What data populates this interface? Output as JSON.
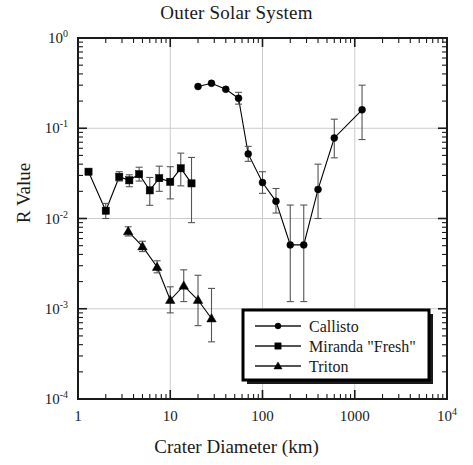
{
  "chart_data": {
    "type": "line",
    "title": "Outer Solar System",
    "xlabel": "Crater Diameter (km)",
    "ylabel": "R Value",
    "xscale": "log",
    "yscale": "log",
    "xlim": [
      1,
      10000
    ],
    "ylim": [
      0.0001,
      1
    ],
    "grid": true,
    "legend_position": "bottom-right",
    "xticks": [
      1,
      10,
      100,
      1000,
      10000
    ],
    "xtick_labels": [
      "1",
      "10",
      "100",
      "1000",
      "10^4"
    ],
    "yticks": [
      1,
      0.1,
      0.01,
      0.001,
      0.0001
    ],
    "ytick_labels": [
      "10^0",
      "10^-1",
      "10^-2",
      "10^-3",
      "10^-4"
    ],
    "series": [
      {
        "name": "Callisto",
        "marker": "circle",
        "color": "#000000",
        "x": [
          20,
          28,
          40,
          55,
          70,
          100,
          140,
          200,
          280,
          400,
          600,
          1200
        ],
        "y": [
          0.29,
          0.315,
          0.27,
          0.215,
          0.052,
          0.025,
          0.0155,
          0.0051,
          0.0051,
          0.021,
          0.078,
          0.16
        ],
        "yerr_low": [
          0.0,
          0.0,
          0.0,
          0.03,
          0.009,
          0.006,
          0.004,
          0.0039,
          0.0039,
          0.011,
          0.031,
          0.085
        ],
        "yerr_high": [
          0.0,
          0.0,
          0.0,
          0.035,
          0.011,
          0.008,
          0.006,
          0.009,
          0.009,
          0.019,
          0.048,
          0.14
        ]
      },
      {
        "name": "Miranda \"Fresh\"",
        "marker": "square",
        "color": "#000000",
        "x": [
          1.3,
          2.0,
          2.8,
          3.6,
          4.6,
          6.0,
          7.6,
          10.0,
          13.0,
          17.0
        ],
        "y": [
          0.033,
          0.0122,
          0.029,
          0.0265,
          0.031,
          0.0205,
          0.028,
          0.0255,
          0.036,
          0.0245
        ],
        "yerr_low": [
          0.0,
          0.0022,
          0.003,
          0.004,
          0.005,
          0.0065,
          0.008,
          0.009,
          0.013,
          0.0155
        ],
        "yerr_high": [
          0.0,
          0.0025,
          0.004,
          0.004,
          0.006,
          0.008,
          0.01,
          0.012,
          0.017,
          0.023
        ]
      },
      {
        "name": "Triton",
        "marker": "triangle",
        "color": "#000000",
        "x": [
          3.5,
          5.0,
          7.2,
          10.0,
          14.0,
          20.0,
          28.0
        ],
        "y": [
          0.0072,
          0.0049,
          0.0029,
          0.00125,
          0.0018,
          0.00125,
          0.00078
        ],
        "yerr_low": [
          0.0008,
          0.0006,
          0.0004,
          0.00035,
          0.0006,
          0.0006,
          0.00035
        ],
        "yerr_high": [
          0.0009,
          0.0007,
          0.0005,
          0.0005,
          0.0009,
          0.0011,
          0.0009
        ]
      }
    ]
  },
  "legend": {
    "items": [
      {
        "label": "Callisto",
        "marker": "circle"
      },
      {
        "label": "Miranda \"Fresh\"",
        "marker": "square"
      },
      {
        "label": "Triton",
        "marker": "triangle"
      }
    ]
  },
  "axes": {
    "title": "Outer Solar System",
    "xlabel": "Crater Diameter (km)",
    "ylabel": "R Value"
  }
}
